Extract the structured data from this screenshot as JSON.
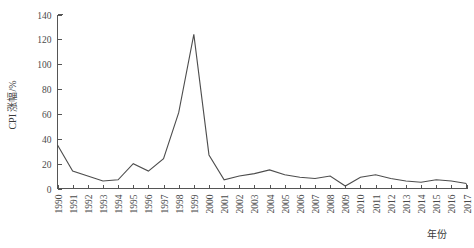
{
  "chart_data": {
    "type": "line",
    "title": "",
    "subtitle": "",
    "xlabel": "年份",
    "ylabel": "CPI 涨幅/%",
    "xlim": [
      1990,
      2017
    ],
    "ylim": [
      0,
      140
    ],
    "yticks": [
      0,
      20,
      40,
      60,
      80,
      100,
      120,
      140
    ],
    "grid": false,
    "legend": null,
    "legend_position": "none",
    "annotations": [],
    "categories": [
      "1990",
      "1991",
      "1992",
      "1993",
      "1994",
      "1995",
      "1996",
      "1997",
      "1998",
      "1999",
      "2000",
      "2001",
      "2002",
      "2003",
      "2004",
      "2005",
      "2006",
      "2007",
      "2008",
      "2009",
      "2010",
      "2011",
      "2012",
      "2013",
      "2014",
      "2015",
      "2016",
      "2017"
    ],
    "values": [
      35,
      14,
      10,
      6,
      7,
      20,
      14,
      24,
      61,
      124,
      27,
      7,
      10,
      12,
      15,
      11,
      9,
      8,
      10,
      2,
      9,
      11,
      8,
      6,
      5,
      7,
      6,
      4
    ],
    "series": [
      {
        "name": "CPI 涨幅",
        "color": "#4d4d4d",
        "values": [
          35,
          14,
          10,
          6,
          7,
          20,
          14,
          24,
          61,
          124,
          27,
          7,
          10,
          12,
          15,
          11,
          9,
          8,
          10,
          2,
          9,
          11,
          8,
          6,
          5,
          7,
          6,
          4
        ]
      }
    ]
  },
  "figure": {
    "axis_color": "#555555",
    "line_color": "#4d4d4d",
    "background": "#ffffff"
  }
}
